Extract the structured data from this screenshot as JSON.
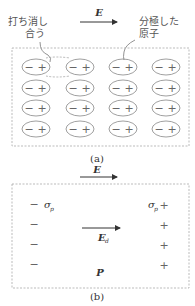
{
  "figure_a": {
    "field_label": "E",
    "label_cancel": [
      "打ち消し",
      "合う"
    ],
    "label_polarized": [
      "分極した",
      "原子"
    ],
    "rows": 4,
    "cols": 4,
    "atom_charges": [
      "−",
      "+"
    ],
    "caption": "(a)"
  },
  "figure_b": {
    "field_label": "E",
    "neg_sigma_label": "σ",
    "neg_sigma_sub": "p",
    "pos_sigma_label": "σ",
    "pos_sigma_sub": "p",
    "neg_sign": "−",
    "pos_sign": "+",
    "depolarizing_field_label": "E",
    "depolarizing_field_sub": "d",
    "polarization_label": "P",
    "caption": "(b)"
  },
  "colors": {
    "stroke": "#888888",
    "text": "#444444",
    "border": "#aaaaaa"
  }
}
